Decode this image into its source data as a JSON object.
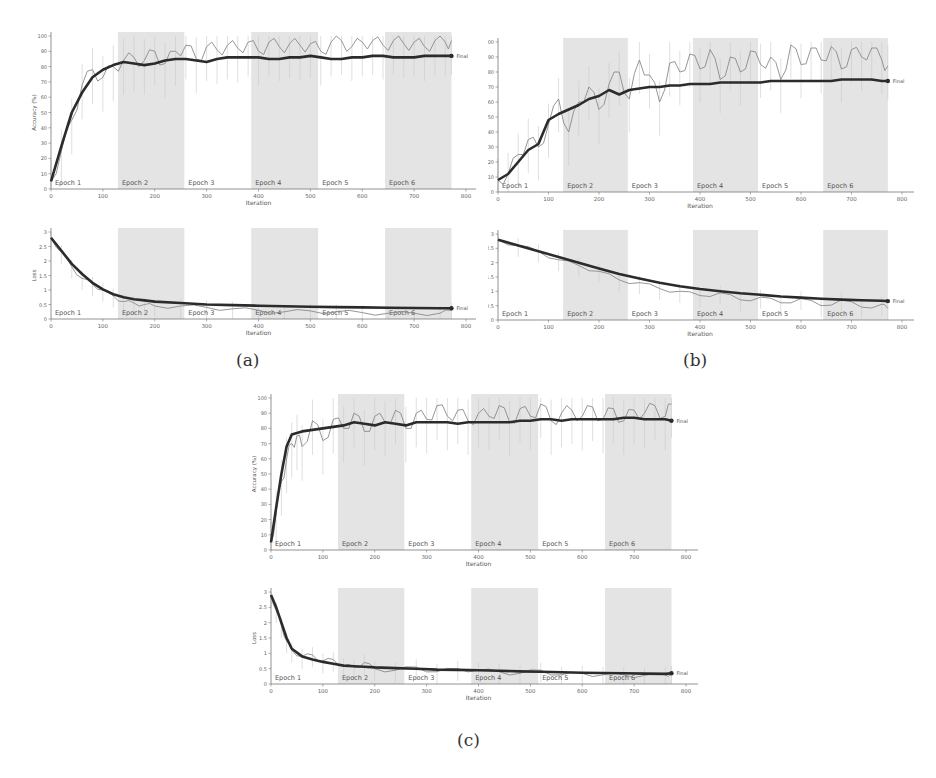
{
  "captions": {
    "a": "(a)",
    "b": "(b)",
    "c": "(c)"
  },
  "common": {
    "xlabel": "Iteration",
    "acc_ylabel": "Accuracy (%)",
    "loss_ylabel": "Loss",
    "final_label": "Final",
    "x_ticks": [
      0,
      100,
      200,
      300,
      400,
      500,
      600,
      700,
      800
    ],
    "acc_ticks": [
      0,
      10,
      20,
      30,
      40,
      50,
      60,
      70,
      80,
      90,
      100
    ],
    "loss_ticks": [
      0,
      0.5,
      1,
      1.5,
      2,
      2.5,
      3
    ],
    "epochs": [
      {
        "label": "Epoch 1",
        "start": 0,
        "end": 129,
        "shaded": false
      },
      {
        "label": "Epoch 2",
        "start": 129,
        "end": 257,
        "shaded": true
      },
      {
        "label": "Epoch 3",
        "start": 257,
        "end": 386,
        "shaded": false
      },
      {
        "label": "Epoch 4",
        "start": 386,
        "end": 515,
        "shaded": true
      },
      {
        "label": "Epoch 5",
        "start": 515,
        "end": 644,
        "shaded": false
      },
      {
        "label": "Epoch 6",
        "start": 644,
        "end": 772,
        "shaded": true
      }
    ],
    "colors": {
      "shade": "#e4e4e4",
      "raw": "#8a8a8a",
      "smooth": "#2b2b2b",
      "axis": "#777777"
    }
  },
  "chart_data": [
    {
      "id": "a-accuracy",
      "type": "line",
      "panel": "a",
      "title": "",
      "xlabel": "Iteration",
      "ylabel": "Accuracy (%)",
      "xlim": [
        0,
        800
      ],
      "ylim": [
        0,
        100
      ],
      "grid": false,
      "series": [
        {
          "name": "raw",
          "x": [
            0,
            20,
            40,
            60,
            80,
            100,
            120,
            140,
            160,
            180,
            200,
            220,
            240,
            260,
            280,
            300,
            320,
            340,
            360,
            380,
            400,
            420,
            440,
            460,
            480,
            500,
            520,
            540,
            560,
            580,
            600,
            620,
            640,
            660,
            680,
            700,
            720,
            740,
            760,
            772
          ],
          "values": [
            5,
            25,
            45,
            68,
            78,
            73,
            80,
            84,
            86,
            84,
            90,
            82,
            90,
            94,
            85,
            93,
            91,
            94,
            92,
            96,
            90,
            96,
            93,
            95,
            94,
            95,
            90,
            96,
            97,
            93,
            96,
            97,
            94,
            97,
            95,
            96,
            93,
            97,
            96,
            97
          ]
        },
        {
          "name": "smoothed",
          "x": [
            0,
            20,
            40,
            60,
            80,
            100,
            120,
            140,
            160,
            180,
            200,
            220,
            240,
            260,
            280,
            300,
            320,
            340,
            360,
            380,
            400,
            420,
            440,
            460,
            480,
            500,
            520,
            540,
            560,
            580,
            600,
            620,
            640,
            660,
            680,
            700,
            720,
            740,
            760,
            772
          ],
          "values": [
            5,
            28,
            50,
            63,
            73,
            78,
            81,
            83,
            82,
            81,
            82,
            84,
            85,
            85,
            84,
            83,
            85,
            86,
            86,
            86,
            86,
            85,
            85,
            86,
            86,
            87,
            86,
            85,
            85,
            86,
            86,
            87,
            87,
            86,
            86,
            86,
            87,
            87,
            87,
            87
          ]
        }
      ],
      "annotations": [
        "Final"
      ]
    },
    {
      "id": "a-loss",
      "type": "line",
      "panel": "a",
      "xlabel": "Iteration",
      "ylabel": "Loss",
      "xlim": [
        0,
        800
      ],
      "ylim": [
        0,
        3
      ],
      "series": [
        {
          "name": "raw",
          "x": [
            0,
            20,
            40,
            60,
            80,
            100,
            120,
            140,
            160,
            180,
            200,
            250,
            300,
            350,
            400,
            450,
            500,
            550,
            600,
            650,
            700,
            750,
            772
          ],
          "values": [
            2.8,
            2.3,
            1.8,
            1.4,
            1.2,
            1.0,
            0.8,
            0.6,
            0.55,
            0.5,
            0.45,
            0.45,
            0.4,
            0.35,
            0.3,
            0.25,
            0.28,
            0.25,
            0.22,
            0.2,
            0.2,
            0.2,
            0.3
          ]
        },
        {
          "name": "smoothed",
          "x": [
            0,
            20,
            40,
            60,
            80,
            100,
            120,
            140,
            160,
            180,
            200,
            250,
            300,
            350,
            400,
            450,
            500,
            550,
            600,
            650,
            700,
            750,
            772
          ],
          "values": [
            2.8,
            2.35,
            1.9,
            1.55,
            1.25,
            1.02,
            0.85,
            0.75,
            0.68,
            0.64,
            0.6,
            0.55,
            0.5,
            0.48,
            0.46,
            0.44,
            0.42,
            0.41,
            0.4,
            0.39,
            0.38,
            0.37,
            0.37
          ]
        }
      ],
      "annotations": [
        "Final"
      ]
    },
    {
      "id": "b-accuracy",
      "type": "line",
      "panel": "b",
      "xlabel": "Iteration",
      "ylabel": "Accuracy (%)",
      "xlim": [
        0,
        800
      ],
      "ylim": [
        0,
        100
      ],
      "series": [
        {
          "name": "raw",
          "x": [
            0,
            20,
            40,
            60,
            80,
            100,
            120,
            140,
            160,
            180,
            200,
            220,
            240,
            260,
            280,
            300,
            320,
            340,
            360,
            380,
            400,
            420,
            440,
            460,
            480,
            500,
            520,
            540,
            560,
            580,
            600,
            620,
            640,
            660,
            680,
            700,
            720,
            740,
            760,
            772
          ],
          "values": [
            8,
            12,
            25,
            35,
            30,
            45,
            62,
            40,
            60,
            70,
            55,
            72,
            80,
            62,
            88,
            78,
            60,
            86,
            80,
            92,
            82,
            95,
            75,
            90,
            80,
            94,
            85,
            90,
            75,
            98,
            85,
            96,
            88,
            97,
            82,
            95,
            90,
            96,
            88,
            84
          ]
        },
        {
          "name": "smoothed",
          "x": [
            0,
            20,
            40,
            60,
            80,
            100,
            120,
            140,
            160,
            180,
            200,
            220,
            240,
            260,
            280,
            300,
            320,
            340,
            360,
            380,
            400,
            420,
            440,
            460,
            480,
            500,
            520,
            540,
            560,
            580,
            600,
            620,
            640,
            660,
            680,
            700,
            720,
            740,
            760,
            772
          ],
          "values": [
            8,
            12,
            20,
            28,
            32,
            48,
            52,
            55,
            58,
            62,
            64,
            68,
            65,
            68,
            69,
            70,
            70,
            71,
            71,
            72,
            72,
            72,
            73,
            73,
            73,
            73,
            73,
            74,
            74,
            74,
            74,
            74,
            74,
            74,
            75,
            75,
            75,
            75,
            74,
            74
          ]
        }
      ],
      "annotations": [
        "Final"
      ]
    },
    {
      "id": "b-loss",
      "type": "line",
      "panel": "b",
      "xlabel": "Iteration",
      "ylabel": "Loss",
      "xlim": [
        0,
        800
      ],
      "ylim": [
        0,
        3
      ],
      "series": [
        {
          "name": "raw",
          "x": [
            0,
            40,
            80,
            120,
            160,
            200,
            240,
            280,
            320,
            360,
            400,
            440,
            480,
            520,
            560,
            600,
            640,
            680,
            720,
            760,
            772
          ],
          "values": [
            2.8,
            2.6,
            2.4,
            2.1,
            1.9,
            1.7,
            1.4,
            1.3,
            1.1,
            1.0,
            0.85,
            0.95,
            0.7,
            0.8,
            0.6,
            0.75,
            0.5,
            0.7,
            0.45,
            0.55,
            0.4
          ]
        },
        {
          "name": "smoothed",
          "x": [
            0,
            40,
            80,
            120,
            160,
            200,
            240,
            280,
            320,
            360,
            400,
            440,
            480,
            520,
            560,
            600,
            640,
            680,
            720,
            760,
            772
          ],
          "values": [
            2.8,
            2.6,
            2.4,
            2.2,
            2.0,
            1.8,
            1.6,
            1.45,
            1.3,
            1.18,
            1.08,
            1.0,
            0.93,
            0.88,
            0.82,
            0.78,
            0.74,
            0.71,
            0.69,
            0.67,
            0.66
          ]
        }
      ],
      "annotations": [
        "Final"
      ]
    },
    {
      "id": "c-accuracy",
      "type": "line",
      "panel": "c",
      "xlabel": "Iteration",
      "ylabel": "Accuracy (%)",
      "xlim": [
        0,
        800
      ],
      "ylim": [
        0,
        100
      ],
      "series": [
        {
          "name": "raw",
          "x": [
            0,
            10,
            20,
            30,
            40,
            50,
            60,
            80,
            100,
            120,
            140,
            160,
            180,
            200,
            220,
            240,
            260,
            280,
            300,
            320,
            340,
            360,
            380,
            400,
            420,
            440,
            460,
            480,
            500,
            520,
            540,
            560,
            580,
            600,
            620,
            640,
            660,
            680,
            700,
            720,
            740,
            760,
            772
          ],
          "values": [
            5,
            25,
            45,
            60,
            70,
            75,
            68,
            85,
            72,
            86,
            80,
            90,
            78,
            88,
            84,
            92,
            80,
            90,
            86,
            95,
            88,
            92,
            85,
            90,
            88,
            95,
            84,
            93,
            88,
            96,
            85,
            90,
            92,
            88,
            94,
            86,
            93,
            85,
            92,
            90,
            95,
            88,
            96
          ]
        },
        {
          "name": "smoothed",
          "x": [
            0,
            10,
            20,
            30,
            40,
            50,
            60,
            80,
            100,
            120,
            140,
            160,
            180,
            200,
            220,
            240,
            260,
            280,
            300,
            320,
            340,
            360,
            380,
            400,
            420,
            440,
            460,
            480,
            500,
            520,
            540,
            560,
            580,
            600,
            620,
            640,
            660,
            680,
            700,
            720,
            740,
            760,
            772
          ],
          "values": [
            5,
            28,
            50,
            68,
            76,
            77,
            78,
            79,
            80,
            81,
            82,
            84,
            83,
            82,
            84,
            83,
            82,
            84,
            84,
            84,
            84,
            83,
            84,
            84,
            84,
            84,
            84,
            85,
            85,
            86,
            86,
            85,
            86,
            86,
            86,
            86,
            86,
            87,
            87,
            86,
            86,
            86,
            85
          ]
        }
      ],
      "annotations": [
        "Final"
      ]
    },
    {
      "id": "c-loss",
      "type": "line",
      "panel": "c",
      "xlabel": "Iteration",
      "ylabel": "Loss",
      "xlim": [
        0,
        800
      ],
      "ylim": [
        0,
        3
      ],
      "series": [
        {
          "name": "raw",
          "x": [
            0,
            10,
            20,
            30,
            40,
            60,
            80,
            100,
            120,
            140,
            160,
            180,
            200,
            240,
            280,
            320,
            360,
            400,
            440,
            480,
            520,
            560,
            600,
            640,
            680,
            720,
            760,
            772
          ],
          "values": [
            2.9,
            2.4,
            1.9,
            1.4,
            1.1,
            0.9,
            0.95,
            0.75,
            0.8,
            0.6,
            0.55,
            0.7,
            0.5,
            0.45,
            0.55,
            0.4,
            0.5,
            0.45,
            0.4,
            0.35,
            0.45,
            0.3,
            0.35,
            0.3,
            0.3,
            0.28,
            0.3,
            0.35
          ]
        },
        {
          "name": "smoothed",
          "x": [
            0,
            10,
            20,
            30,
            40,
            60,
            80,
            100,
            120,
            140,
            160,
            180,
            200,
            240,
            280,
            320,
            360,
            400,
            440,
            480,
            520,
            560,
            600,
            640,
            680,
            720,
            760,
            772
          ],
          "values": [
            2.9,
            2.5,
            2.0,
            1.5,
            1.15,
            0.9,
            0.8,
            0.72,
            0.66,
            0.6,
            0.58,
            0.56,
            0.54,
            0.52,
            0.5,
            0.47,
            0.46,
            0.45,
            0.43,
            0.41,
            0.4,
            0.38,
            0.37,
            0.36,
            0.35,
            0.34,
            0.33,
            0.35
          ]
        }
      ],
      "annotations": [
        "Final"
      ]
    }
  ]
}
